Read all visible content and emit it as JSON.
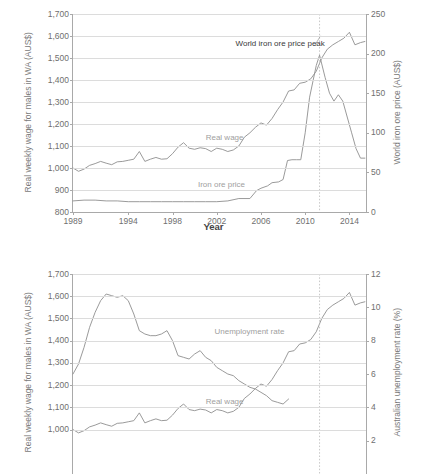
{
  "figure": {
    "xlabel": "Year"
  },
  "chart_data": [
    {
      "id": "top",
      "type": "line",
      "title": "",
      "xlabel": "Year",
      "ylabel": "Real weekly wage for males in WA (AUS$)",
      "y2label": "World iron ore price (AUS$)",
      "xlim": [
        1989,
        2015.5
      ],
      "ylim": [
        800,
        1700
      ],
      "y2lim": [
        0,
        250
      ],
      "grid": true,
      "legend_position": "inline-labels",
      "xticks": [
        "1989",
        "1994",
        "1998",
        "2002",
        "2006",
        "2010",
        "2014"
      ],
      "xtick_values": [
        1989,
        1994,
        1998,
        2002,
        2006,
        2010,
        2014
      ],
      "yticks": [
        "800",
        "900",
        "1,000",
        "1,100",
        "1,200",
        "1,300",
        "1,400",
        "1,500",
        "1,600",
        "1,700"
      ],
      "ytick_values": [
        800,
        900,
        1000,
        1100,
        1200,
        1300,
        1400,
        1500,
        1600,
        1700
      ],
      "y2ticks": [
        "0",
        "50",
        "100",
        "150",
        "200",
        "250"
      ],
      "y2tick_values": [
        0,
        50,
        100,
        150,
        200,
        250
      ],
      "annotations": [
        {
          "text": "World iron ore price peak",
          "x": 2011.3,
          "y": 1560
        }
      ],
      "vertical_marker": {
        "x": 2011.3,
        "style": "dotted"
      },
      "series": [
        {
          "name": "Real wage",
          "axis": "left",
          "label_x": 2001.0,
          "label_y": 1135,
          "x": [
            1989.0,
            1989.5,
            1990.0,
            1990.5,
            1991.0,
            1991.5,
            1992.0,
            1992.5,
            1993.0,
            1993.5,
            1994.0,
            1994.5,
            1995.0,
            1995.5,
            1996.0,
            1996.5,
            1997.0,
            1997.5,
            1998.0,
            1998.5,
            1999.0,
            1999.5,
            2000.0,
            2000.5,
            2001.0,
            2001.5,
            2002.0,
            2002.5,
            2003.0,
            2003.5,
            2004.0,
            2004.5,
            2005.0,
            2005.5,
            2006.0,
            2006.5,
            2007.0,
            2007.5,
            2008.0,
            2008.5,
            2009.0,
            2009.5,
            2010.0,
            2010.5,
            2011.0,
            2011.5,
            2012.0,
            2012.5,
            2013.0,
            2013.5,
            2014.0,
            2014.5,
            2015.0,
            2015.4
          ],
          "y": [
            1000,
            985,
            995,
            1012,
            1020,
            1030,
            1022,
            1015,
            1028,
            1030,
            1035,
            1040,
            1075,
            1030,
            1040,
            1048,
            1040,
            1042,
            1065,
            1095,
            1115,
            1090,
            1085,
            1092,
            1088,
            1075,
            1090,
            1085,
            1075,
            1082,
            1100,
            1140,
            1160,
            1185,
            1205,
            1195,
            1225,
            1265,
            1300,
            1350,
            1355,
            1385,
            1390,
            1405,
            1440,
            1500,
            1540,
            1560,
            1575,
            1590,
            1617,
            1560,
            1570,
            1575
          ]
        },
        {
          "name": "Iron ore price",
          "axis": "right",
          "label_x": 2000.3,
          "label_y": 925,
          "x": [
            1989.0,
            1990.0,
            1991.0,
            1992.0,
            1993.0,
            1994.0,
            1995.0,
            1996.0,
            1997.0,
            1998.0,
            1999.0,
            2000.0,
            2001.0,
            2002.0,
            2003.0,
            2004.0,
            2005.0,
            2005.6,
            2006.0,
            2006.6,
            2007.0,
            2007.6,
            2008.0,
            2008.4,
            2008.8,
            2009.2,
            2009.6,
            2010.0,
            2010.4,
            2011.0,
            2011.3,
            2011.8,
            2012.2,
            2012.6,
            2013.0,
            2013.4,
            2013.8,
            2014.2,
            2014.6,
            2015.0,
            2015.4
          ],
          "y_right": [
            14,
            15,
            15,
            14,
            14,
            13,
            13,
            13,
            13,
            13,
            13,
            13,
            13,
            13,
            14,
            17,
            17,
            27,
            30,
            33,
            37,
            38,
            41,
            65,
            66,
            66,
            66,
            100,
            145,
            185,
            198,
            170,
            150,
            140,
            148,
            140,
            120,
            100,
            80,
            68,
            68
          ]
        }
      ]
    },
    {
      "id": "bottom",
      "type": "line",
      "title": "",
      "xlabel": "Year",
      "ylabel": "Real weekly wage for males in WA (AUS$)",
      "y2label": "Australian unemployment rate (%)",
      "xlim": [
        1989,
        2015.5
      ],
      "ylim": [
        800,
        1700
      ],
      "y2lim": [
        0,
        12
      ],
      "grid": true,
      "legend_position": "inline-labels",
      "xticks": [],
      "yticks": [
        "1,000",
        "1,100",
        "1,200",
        "1,300",
        "1,400",
        "1,500",
        "1,600",
        "1,700"
      ],
      "ytick_values": [
        1000,
        1100,
        1200,
        1300,
        1400,
        1500,
        1600,
        1700
      ],
      "y2ticks": [
        "2",
        "4",
        "6",
        "8",
        "10",
        "12"
      ],
      "y2tick_values": [
        2,
        4,
        6,
        8,
        10,
        12
      ],
      "vertical_marker": {
        "x": 2011.3,
        "style": "dotted"
      },
      "series": [
        {
          "name": "Unemployment rate",
          "axis": "right",
          "label_x": 2001.8,
          "label_y": 1438,
          "x": [
            1989.0,
            1989.5,
            1990.0,
            1990.5,
            1991.0,
            1991.5,
            1992.0,
            1992.5,
            1993.0,
            1993.5,
            1994.0,
            1994.5,
            1995.0,
            1995.5,
            1996.0,
            1996.5,
            1997.0,
            1997.5,
            1998.0,
            1998.5,
            1999.0,
            1999.5,
            2000.0,
            2000.5,
            2001.0,
            2001.5,
            2002.0,
            2002.5,
            2003.0,
            2003.5,
            2004.0,
            2004.5,
            2005.0,
            2005.5,
            2006.0,
            2006.5,
            2007.0,
            2007.5,
            2008.0,
            2008.5
          ],
          "y_right": [
            6.0,
            6.6,
            7.6,
            8.8,
            9.7,
            10.4,
            10.8,
            10.7,
            10.6,
            10.7,
            10.4,
            9.6,
            8.6,
            8.4,
            8.3,
            8.3,
            8.4,
            8.6,
            8.0,
            7.1,
            7.0,
            6.9,
            7.2,
            7.4,
            7.0,
            6.8,
            6.4,
            6.2,
            6.0,
            5.9,
            5.6,
            5.4,
            5.2,
            5.1,
            4.9,
            4.7,
            4.4,
            4.3,
            4.2,
            4.5
          ]
        },
        {
          "name": "Real wage",
          "axis": "left",
          "label_x": 2001.0,
          "label_y": 1125,
          "x": [
            1989.0,
            1989.5,
            1990.0,
            1990.5,
            1991.0,
            1991.5,
            1992.0,
            1992.5,
            1993.0,
            1993.5,
            1994.0,
            1994.5,
            1995.0,
            1995.5,
            1996.0,
            1996.5,
            1997.0,
            1997.5,
            1998.0,
            1998.5,
            1999.0,
            1999.5,
            2000.0,
            2000.5,
            2001.0,
            2001.5,
            2002.0,
            2002.5,
            2003.0,
            2003.5,
            2004.0,
            2004.5,
            2005.0,
            2005.5,
            2006.0,
            2006.5,
            2007.0,
            2007.5,
            2008.0,
            2008.5,
            2009.0,
            2009.5,
            2010.0,
            2010.5,
            2011.0,
            2011.5,
            2012.0,
            2012.5,
            2013.0,
            2013.5,
            2014.0,
            2014.5,
            2015.0,
            2015.4
          ],
          "y": [
            1000,
            985,
            995,
            1012,
            1020,
            1030,
            1022,
            1015,
            1028,
            1030,
            1035,
            1040,
            1075,
            1030,
            1040,
            1048,
            1040,
            1042,
            1065,
            1095,
            1115,
            1090,
            1085,
            1092,
            1088,
            1075,
            1090,
            1085,
            1075,
            1082,
            1100,
            1140,
            1160,
            1185,
            1205,
            1195,
            1225,
            1265,
            1300,
            1350,
            1355,
            1385,
            1390,
            1405,
            1440,
            1500,
            1540,
            1560,
            1575,
            1590,
            1617,
            1560,
            1570,
            1575
          ]
        }
      ]
    }
  ]
}
